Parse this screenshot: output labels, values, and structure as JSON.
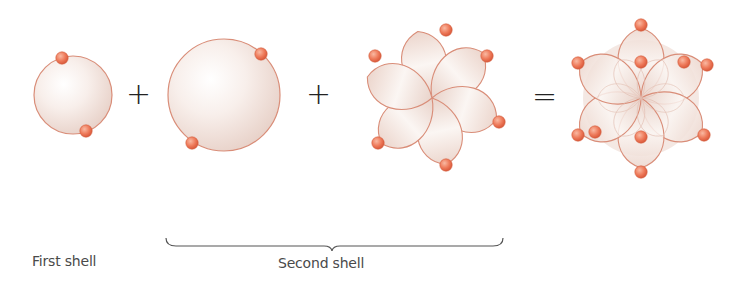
{
  "diagram": {
    "type": "electron-shell-orbital-combination",
    "colors": {
      "orbital_fill_light": "#fbf5f2",
      "orbital_fill_dark": "#e9d3cb",
      "orbital_outline": "#d98d78",
      "electron": "#ee7a5a",
      "electron_highlight": "#f9b9a2",
      "text": "#4a4a4a",
      "operator": "#222222"
    },
    "components": [
      {
        "id": "first-shell-orbital",
        "shape": "sphere",
        "center": [
          73,
          95
        ],
        "radius": 39,
        "electrons": [
          [
            62,
            58
          ],
          [
            86,
            131
          ]
        ]
      },
      {
        "id": "second-shell-s-orbital",
        "shape": "sphere",
        "center": [
          224,
          95
        ],
        "radius": 56,
        "electrons": [
          [
            261,
            54
          ],
          [
            192,
            143
          ]
        ]
      },
      {
        "id": "second-shell-p-orbitals",
        "shape": "six-lobed-flower",
        "center": [
          432,
          98
        ],
        "lobe_length": 68,
        "electrons": [
          [
            446,
            30
          ],
          [
            375,
            56
          ],
          [
            487,
            56
          ],
          [
            499,
            122
          ],
          [
            378,
            143
          ],
          [
            446,
            165
          ]
        ]
      },
      {
        "id": "combined-orbitals",
        "shape": "six-lobed-overlay",
        "center": [
          641,
          98
        ],
        "lobe_length": 70,
        "electrons": [
          [
            641,
            25
          ],
          [
            641,
            62
          ],
          [
            578,
            63
          ],
          [
            684,
            62
          ],
          [
            707,
            65
          ],
          [
            578,
            135
          ],
          [
            595,
            132
          ],
          [
            641,
            137
          ],
          [
            704,
            135
          ],
          [
            641,
            172
          ]
        ]
      }
    ],
    "operators": [
      {
        "symbol": "+",
        "position": [
          136,
          95
        ]
      },
      {
        "symbol": "+",
        "position": [
          316,
          95
        ]
      },
      {
        "symbol": "=",
        "position": [
          542,
          98
        ]
      }
    ],
    "brace": {
      "x_start": 166,
      "x_end": 503,
      "y": 246,
      "tip_x": 332
    },
    "labels": {
      "first_shell": "First shell",
      "second_shell": "Second shell"
    }
  }
}
